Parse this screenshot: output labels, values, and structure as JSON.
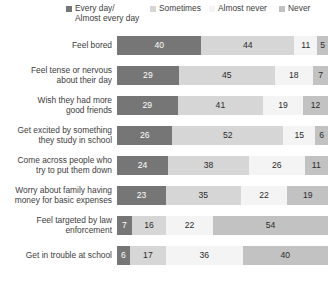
{
  "legend": {
    "items": [
      {
        "label_line1": "Every day/",
        "label_line2": "Almost every day",
        "color": "#767676"
      },
      {
        "label_line1": "Sometimes",
        "label_line2": "",
        "color": "#d6d6d6"
      },
      {
        "label_line1": "Almost never",
        "label_line2": "",
        "color": "#f4f4f4"
      },
      {
        "label_line1": "Never",
        "label_line2": "",
        "color": "#c2c2c2"
      }
    ]
  },
  "chart_data": {
    "type": "bar",
    "title": "",
    "subtitle": "",
    "xlabel": "",
    "ylabel": "",
    "orientation": "horizontal",
    "stacked": true,
    "grid": false,
    "legend_position": "top",
    "xlim": [
      0,
      100
    ],
    "categories": [
      "Feel bored",
      "Feel tense or nervous about their day",
      "Wish they had more good friends",
      "Get excited by something they study in school",
      "Come across people who try to put them down",
      "Worry about family having money for basic expenses",
      "Feel targeted by law enforcement",
      "Get in trouble at school"
    ],
    "series": [
      {
        "name": "Every day/Almost every day",
        "color": "#767676",
        "values": [
          40,
          29,
          29,
          26,
          24,
          23,
          7,
          6
        ]
      },
      {
        "name": "Sometimes",
        "color": "#d6d6d6",
        "values": [
          44,
          45,
          41,
          52,
          38,
          35,
          16,
          17
        ]
      },
      {
        "name": "Almost never",
        "color": "#f4f4f4",
        "values": [
          11,
          18,
          19,
          15,
          26,
          22,
          22,
          36
        ]
      },
      {
        "name": "Never",
        "color": "#c2c2c2",
        "values": [
          5,
          7,
          12,
          6,
          11,
          19,
          54,
          40
        ]
      }
    ]
  },
  "rows": [
    {
      "label_line1": "Feel bored",
      "label_line2": "",
      "values": [
        40,
        44,
        11,
        5
      ]
    },
    {
      "label_line1": "Feel tense or nervous",
      "label_line2": "about their day",
      "values": [
        29,
        45,
        18,
        7
      ]
    },
    {
      "label_line1": "Wish they had more",
      "label_line2": "good friends",
      "values": [
        29,
        41,
        19,
        12
      ]
    },
    {
      "label_line1": "Get excited by something",
      "label_line2": "they study in school",
      "values": [
        26,
        52,
        15,
        6
      ]
    },
    {
      "label_line1": "Come across people who",
      "label_line2": "try to put them down",
      "values": [
        24,
        38,
        26,
        11
      ]
    },
    {
      "label_line1": "Worry about family having",
      "label_line2": "money for basic expenses",
      "values": [
        23,
        35,
        22,
        19
      ]
    },
    {
      "label_line1": "Feel targeted by law",
      "label_line2": "enforcement",
      "values": [
        7,
        16,
        22,
        54
      ]
    },
    {
      "label_line1": "Get in trouble at school",
      "label_line2": "",
      "values": [
        6,
        17,
        36,
        40
      ]
    }
  ]
}
